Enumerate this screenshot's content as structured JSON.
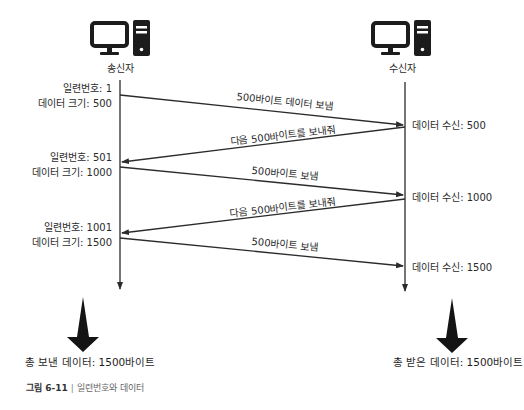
{
  "participants": {
    "sender": {
      "label": "송신자",
      "icon": "desktop-computer-icon"
    },
    "receiver": {
      "label": "수신자",
      "icon": "desktop-computer-icon"
    }
  },
  "sender_notes": [
    {
      "seq_label": "일련번호: 1",
      "size_label": "데이터 크기: 500"
    },
    {
      "seq_label": "일련번호: 501",
      "size_label": "데이터 크기: 1000"
    },
    {
      "seq_label": "일련번호: 1001",
      "size_label": "데이터 크기: 1500"
    }
  ],
  "receiver_notes": [
    "데이터 수신: 500",
    "데이터 수신: 1000",
    "데이터 수신: 1500"
  ],
  "messages": [
    {
      "from": "sender",
      "to": "receiver",
      "label": "500바이트 데이터 보냄"
    },
    {
      "from": "receiver",
      "to": "sender",
      "label": "다음 500바이트를 보내줘"
    },
    {
      "from": "sender",
      "to": "receiver",
      "label": "500바이트 보냄"
    },
    {
      "from": "receiver",
      "to": "sender",
      "label": "다음 500바이트를 보내줘"
    },
    {
      "from": "sender",
      "to": "receiver",
      "label": "500바이트 보냄"
    }
  ],
  "totals": {
    "sent": "총 보낸 데이터: 1500바이트",
    "received": "총 받은 데이터: 1500바이트"
  },
  "caption": {
    "figure": "그림 6-11",
    "separator": "|",
    "title": "일련번호와 데이터"
  },
  "colors": {
    "line": "#2b2b2b",
    "icon": "#1c1c1c",
    "text": "#2a2a2a"
  }
}
